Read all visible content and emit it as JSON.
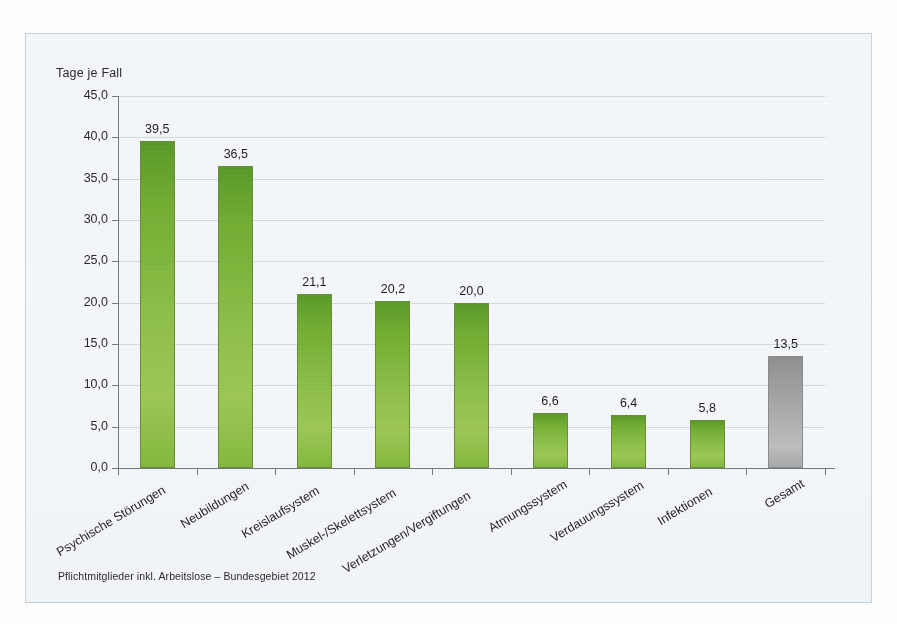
{
  "chart_data": {
    "type": "bar",
    "title": "",
    "ylabel": "Tage je Fall",
    "xlabel": "",
    "ylim": [
      0,
      45
    ],
    "ytick_step": 5,
    "grid": true,
    "legend": "none",
    "categories": [
      "Psychische Störungen",
      "Neubildungen",
      "Kreislaufsystem",
      "Muskel-/Skelettsystem",
      "Verletzungen/Vergiftungen",
      "Atmungssystem",
      "Verdauungssystem",
      "Infektionen",
      "Gesamt"
    ],
    "values": [
      39.5,
      36.5,
      21.1,
      20.2,
      20.0,
      6.6,
      6.4,
      5.8,
      13.5
    ],
    "value_labels": [
      "39,5",
      "36,5",
      "21,1",
      "20,2",
      "20,0",
      "6,6",
      "6,4",
      "5,8",
      "13,5"
    ],
    "ytick_labels": [
      "45,0",
      "40,0",
      "35,0",
      "30,0",
      "25,0",
      "20,0",
      "15,0",
      "10,0",
      "5,0",
      "0,0"
    ],
    "ytick_values": [
      45,
      40,
      35,
      30,
      25,
      20,
      15,
      10,
      5,
      0
    ],
    "bar_colors": [
      "#8fc04a",
      "#8fc04a",
      "#8fc04a",
      "#8fc04a",
      "#8fc04a",
      "#8fc04a",
      "#8fc04a",
      "#8fc04a",
      "#b0b0b0"
    ],
    "accent_green": "#8fc04a",
    "accent_gray": "#b0b0b0",
    "background": "#f3f6f9",
    "gridline_color": "#d2dade",
    "axis_color": "#6f7b80"
  },
  "footnote": "Pflichtmitglieder inkl. Arbeitslose – Bundesgebiet 2012"
}
